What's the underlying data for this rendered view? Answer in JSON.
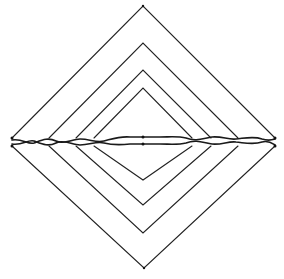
{
  "figure": {
    "background": "#ffffff",
    "stroke_color": "#222222",
    "diamonds": [
      {
        "name": "outer",
        "top": [
          143,
          6
        ],
        "bottom": [
          144,
          268
        ],
        "left_upper": [
          12,
          138
        ],
        "left_lower": [
          12,
          146
        ],
        "right_upper": [
          275,
          138
        ],
        "right_lower": [
          275,
          146
        ]
      },
      {
        "name": "second",
        "top": [
          143,
          43
        ],
        "bottom": [
          143,
          233
        ],
        "left_upper": [
          49,
          138
        ],
        "left_lower": [
          49,
          146
        ],
        "right_upper": [
          238,
          138
        ],
        "right_lower": [
          238,
          146
        ]
      },
      {
        "name": "third",
        "top": [
          143,
          70
        ],
        "bottom": [
          143,
          205
        ],
        "left_upper": [
          76,
          138
        ],
        "left_lower": [
          76,
          146
        ],
        "right_upper": [
          211,
          138
        ],
        "right_lower": [
          211,
          146
        ]
      },
      {
        "name": "inner",
        "top": [
          143,
          88
        ],
        "bottom": [
          143,
          180
        ],
        "left_upper": [
          94,
          138
        ],
        "left_lower": [
          94,
          146
        ],
        "right_upper": [
          192,
          138
        ],
        "right_lower": [
          192,
          146
        ]
      }
    ],
    "bands": {
      "upper_y": 138,
      "lower_y": 144,
      "left_x": 12,
      "right_x": 275
    }
  }
}
